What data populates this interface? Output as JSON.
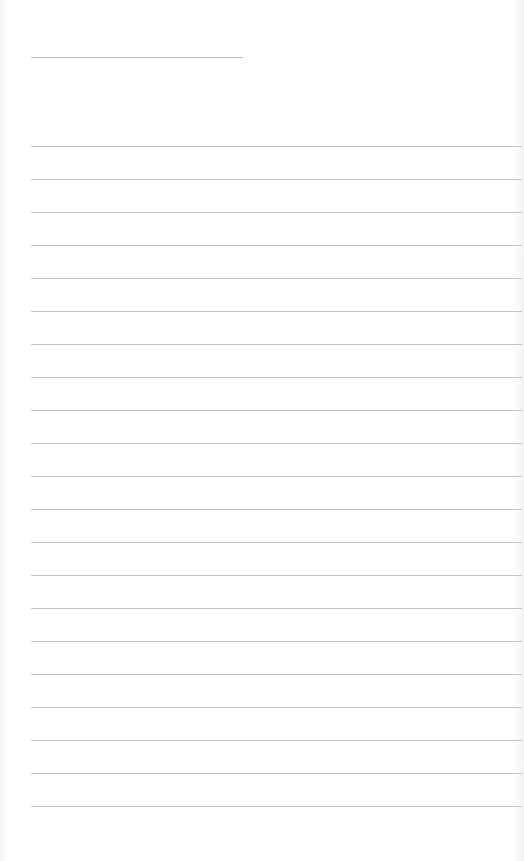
{
  "document": {
    "type": "lined-paper",
    "title_field": {
      "text": "",
      "line_color": "#b8b8b8"
    },
    "ruled_lines": {
      "count": 21,
      "first_y": 146,
      "spacing": 33,
      "color": "#c4c4c4"
    },
    "body_text": ""
  }
}
